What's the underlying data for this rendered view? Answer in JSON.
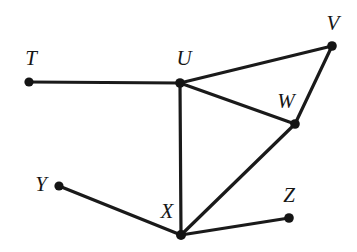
{
  "diagram": {
    "type": "undirected-graph",
    "canvas": {
      "width": 357,
      "height": 252
    },
    "background_color": "#ffffff",
    "edge_color": "#1a1a1a",
    "node_color": "#141414",
    "label_color": "#161616",
    "nodes": [
      {
        "id": "T",
        "label": "T",
        "x": 29,
        "y": 82,
        "r": 4.6,
        "label_x": 31,
        "label_y": 58
      },
      {
        "id": "U",
        "label": "U",
        "x": 180,
        "y": 83,
        "r": 4.8,
        "label_x": 184,
        "label_y": 58
      },
      {
        "id": "V",
        "label": "V",
        "x": 332,
        "y": 46,
        "r": 4.8,
        "label_x": 333,
        "label_y": 23
      },
      {
        "id": "W",
        "label": "W",
        "x": 295,
        "y": 124,
        "r": 4.8,
        "label_x": 286,
        "label_y": 101
      },
      {
        "id": "X",
        "label": "X",
        "x": 181,
        "y": 235,
        "r": 5.0,
        "label_x": 167,
        "label_y": 211
      },
      {
        "id": "Y",
        "label": "Y",
        "x": 59,
        "y": 186,
        "r": 4.6,
        "label_x": 41,
        "label_y": 184
      },
      {
        "id": "Z",
        "label": "Z",
        "x": 289,
        "y": 218,
        "r": 4.8,
        "label_x": 289,
        "label_y": 195
      }
    ],
    "edges": [
      {
        "id": "T-U",
        "from": "T",
        "to": "U"
      },
      {
        "id": "U-V",
        "from": "U",
        "to": "V"
      },
      {
        "id": "U-W",
        "from": "U",
        "to": "W"
      },
      {
        "id": "U-X",
        "from": "U",
        "to": "X"
      },
      {
        "id": "V-W",
        "from": "V",
        "to": "W"
      },
      {
        "id": "W-X",
        "from": "W",
        "to": "X"
      },
      {
        "id": "X-Y",
        "from": "X",
        "to": "Y"
      },
      {
        "id": "X-Z",
        "from": "X",
        "to": "Z"
      }
    ]
  }
}
